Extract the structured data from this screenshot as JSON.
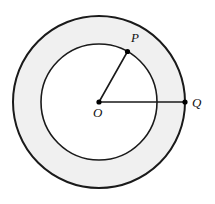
{
  "figure": {
    "name": "annulus-with-radii",
    "caption": "",
    "background_color": "#ffffff",
    "stroke_color": "#1a1a1a",
    "annulus_fill": "#f0f0f0",
    "inner_fill": "#ffffff",
    "point_color": "#000000",
    "geometry": {
      "center": {
        "x": 99,
        "y": 102
      },
      "inner_radius": 58,
      "outer_radius": 86,
      "outer_stroke_width": 2.0,
      "inner_stroke_width": 1.6,
      "radius_line_width": 1.6,
      "point_radius": 2.6
    },
    "points": [
      {
        "id": "O",
        "label": "O",
        "x": 99,
        "y": 102,
        "label_x": 93,
        "label_y": 117,
        "label_size": 13,
        "on": "center"
      },
      {
        "id": "P",
        "label": "P",
        "x": 127.5,
        "y": 51.5,
        "label_x": 131,
        "label_y": 42,
        "label_size": 13,
        "on": "inner-circle"
      },
      {
        "id": "Q",
        "label": "Q",
        "x": 185,
        "y": 102,
        "label_x": 192,
        "label_y": 107,
        "label_size": 13,
        "on": "outer-circle"
      }
    ],
    "segments": [
      {
        "id": "OP",
        "from": "O",
        "to": "P",
        "name": "radius-op"
      },
      {
        "id": "OQ",
        "from": "O",
        "to": "Q",
        "name": "radius-oq"
      }
    ]
  }
}
